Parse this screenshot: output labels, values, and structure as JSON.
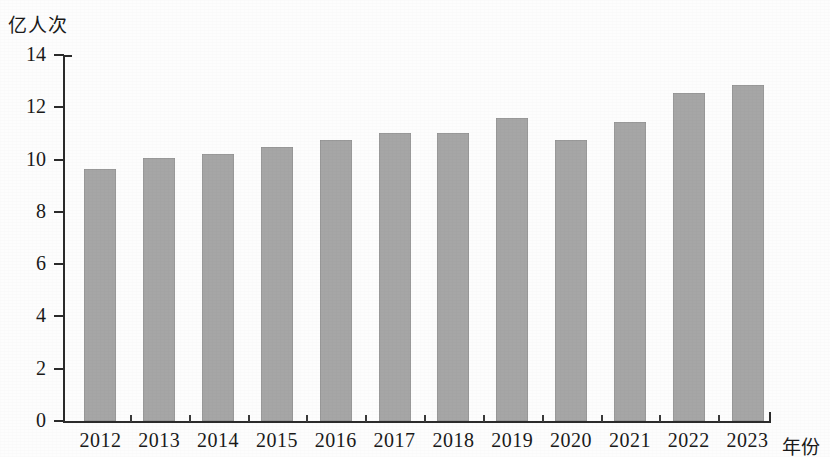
{
  "chart_data": {
    "type": "bar",
    "title": "",
    "subtitle": "",
    "xlabel": "年份",
    "ylabel": "亿人次",
    "categories": [
      "2012",
      "2013",
      "2014",
      "2015",
      "2016",
      "2017",
      "2018",
      "2019",
      "2020",
      "2021",
      "2022",
      "2023"
    ],
    "values": [
      9.65,
      10.05,
      10.2,
      10.5,
      10.75,
      11.0,
      11.0,
      11.6,
      10.75,
      11.45,
      12.55,
      12.85
    ],
    "series": [
      {
        "name": "亿人次",
        "values": [
          9.65,
          10.05,
          10.2,
          10.5,
          10.75,
          11.0,
          11.0,
          11.6,
          10.75,
          11.45,
          12.55,
          12.85
        ]
      }
    ],
    "ylim": [
      0,
      14
    ],
    "ytick_labels": [
      "0",
      "2",
      "4",
      "6",
      "8",
      "10",
      "12",
      "14"
    ],
    "ytick_values": [
      0,
      2,
      4,
      6,
      8,
      10,
      12,
      14
    ],
    "grid": false,
    "legend": false,
    "legend_position": "none",
    "bar_color": "#a6a6a6",
    "axis_color": "#2b2b2b",
    "background_color": "#fdfdfd"
  }
}
